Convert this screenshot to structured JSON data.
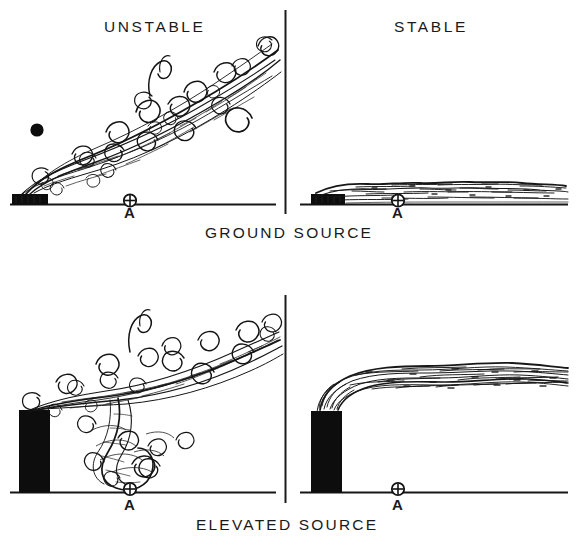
{
  "figure": {
    "kind": "plume-dispersion-diagram",
    "background_color": "#ffffff",
    "ink_color": "#111111"
  },
  "column_titles": [
    {
      "id": "unstable",
      "label": "UNSTABLE"
    },
    {
      "id": "stable",
      "label": "STABLE"
    }
  ],
  "row_captions": [
    {
      "id": "ground-source",
      "label": "GROUND SOURCE"
    },
    {
      "id": "elevated-source",
      "label": "ELEVATED SOURCE"
    }
  ],
  "receptor_markers": [
    {
      "id": "a-top-left",
      "label": "A",
      "symbol": "circled-cross-icon"
    },
    {
      "id": "a-top-right",
      "label": "A",
      "symbol": "circled-cross-icon"
    },
    {
      "id": "a-bottom-left",
      "label": "A",
      "symbol": "circled-cross-icon"
    },
    {
      "id": "a-bottom-right",
      "label": "A",
      "symbol": "circled-cross-icon"
    }
  ],
  "panels": [
    {
      "id": "panel-ground-unstable",
      "column": "UNSTABLE",
      "row": "GROUND SOURCE",
      "source_type": "low flat block",
      "plume": "looping turbulent plume rising to the right with many eddies",
      "extra_marker": "solid-dot-icon"
    },
    {
      "id": "panel-ground-stable",
      "column": "STABLE",
      "row": "GROUND SOURCE",
      "source_type": "low flat block",
      "plume": "thin fanning layer hugging the ground"
    },
    {
      "id": "panel-elevated-unstable",
      "column": "UNSTABLE",
      "row": "ELEVATED SOURCE",
      "source_type": "tall stack",
      "plume": "looping plume with downwash eddy reaching ground at A"
    },
    {
      "id": "panel-elevated-stable",
      "column": "STABLE",
      "row": "ELEVATED SOURCE",
      "source_type": "tall stack",
      "plume": "coning/fanning ribbon plume carried horizontally aloft"
    }
  ]
}
